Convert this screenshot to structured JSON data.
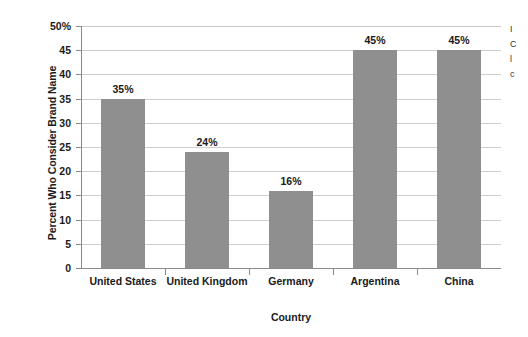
{
  "chart_data": {
    "type": "bar",
    "title": "",
    "xlabel": "Country",
    "ylabel": "Percent Who Consider Brand Name",
    "categories": [
      "United States",
      "United Kingdom",
      "Germany",
      "Argentina",
      "China"
    ],
    "values": [
      35,
      24,
      16,
      45,
      45
    ],
    "value_labels": [
      "35%",
      "24%",
      "16%",
      "45%",
      "45%"
    ],
    "ylim": [
      0,
      50
    ],
    "ytick_values": [
      0,
      5,
      10,
      15,
      20,
      25,
      30,
      35,
      40,
      45,
      50
    ],
    "ytick_labels": [
      "0",
      "5",
      "10",
      "15",
      "20",
      "25",
      "30",
      "35",
      "40",
      "45",
      "50%"
    ],
    "grid": true,
    "legend": null,
    "bar_color": "#8f8f8f",
    "grid_color": "#cfcfcf",
    "axis_color": "#8a8a8a",
    "background_color": "#ffffff"
  },
  "edge_fragment": {
    "lines": [
      "I",
      "C",
      "l",
      "c"
    ]
  }
}
